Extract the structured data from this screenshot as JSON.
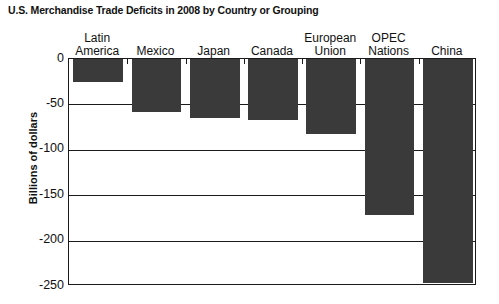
{
  "chart_data": {
    "type": "bar",
    "title": "U.S. Merchandise Trade Deficits in 2008 by Country or Grouping",
    "xlabel": "",
    "ylabel": "Billions of dollars",
    "categories": [
      "Latin\nAmerica",
      "Mexico",
      "Japan",
      "Canada",
      "European\nUnion",
      "OPEC\nNations",
      "China"
    ],
    "values": [
      -25,
      -58,
      -65,
      -67,
      -83,
      -172,
      -247
    ],
    "ylim": [
      -250,
      0
    ],
    "yticks": [
      0,
      -50,
      -100,
      -150,
      -200,
      -250
    ],
    "ytick_labels": [
      "0",
      "-50",
      "-100",
      "-150",
      "-200",
      "-250"
    ],
    "grid": true,
    "legend": "none",
    "bar_color": "#3a3a3a",
    "axis_color": "#1a1a1a",
    "category_labels_position": "top"
  },
  "axis": {
    "y_title": "Billions of dollars"
  }
}
